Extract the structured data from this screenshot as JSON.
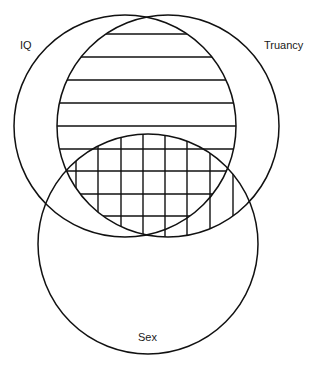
{
  "diagram": {
    "type": "venn",
    "sets": [
      {
        "id": "iq",
        "label": "IQ",
        "cx": 125,
        "cy": 126,
        "r": 111,
        "label_x": 20,
        "label_y": 49
      },
      {
        "id": "truancy",
        "label": "Truancy",
        "cx": 168,
        "cy": 126,
        "r": 111,
        "label_x": 264,
        "label_y": 49
      },
      {
        "id": "sex",
        "label": "Sex",
        "cx": 148,
        "cy": 244,
        "r": 110,
        "label_x": 138,
        "label_y": 341
      }
    ],
    "shaded_regions": [
      {
        "intersection": [
          "IQ",
          "Truancy"
        ],
        "pattern": "horizontal-lines"
      },
      {
        "intersection": [
          "Truancy",
          "Sex"
        ],
        "pattern": "vertical-lines"
      },
      {
        "intersection": [
          "IQ",
          "Truancy",
          "Sex"
        ],
        "pattern": "cross-hatch"
      }
    ],
    "horizontal_line_ys": [
      34,
      57,
      80,
      103,
      126,
      149,
      171,
      194,
      216
    ],
    "vertical_line_xs": [
      76,
      98,
      121,
      143,
      165,
      187,
      210,
      233
    ]
  },
  "labels": {
    "iq": "IQ",
    "truancy": "Truancy",
    "sex": "Sex"
  }
}
